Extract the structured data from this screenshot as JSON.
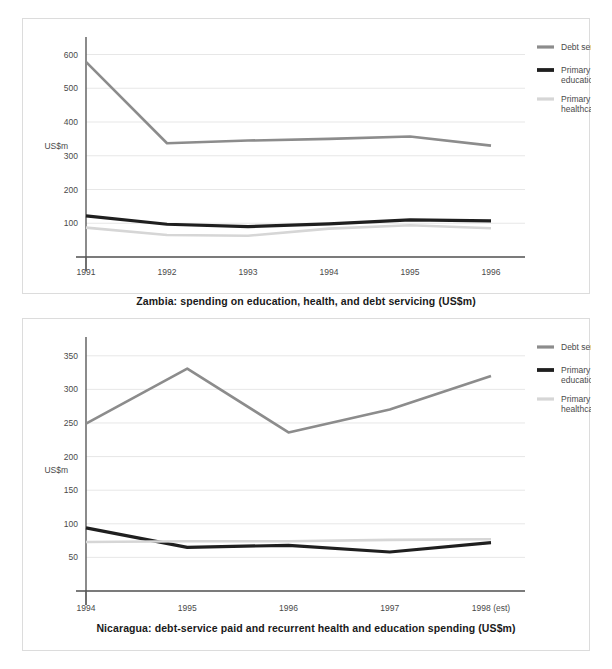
{
  "chart_data": [
    {
      "type": "line",
      "id": "zambia",
      "title": "Zambia: spending on education, health, and debt servicing (US$m)",
      "xlabel": "",
      "ylabel": "US$m",
      "categories": [
        "1991",
        "1992",
        "1993",
        "1994",
        "1995",
        "1996"
      ],
      "yticks": [
        100,
        200,
        300,
        400,
        500,
        600
      ],
      "ylim": [
        0,
        640
      ],
      "grid": true,
      "legend_position": "right",
      "series": [
        {
          "name": "Debt service",
          "color": "#8c8c8c",
          "width": 2.6,
          "values": [
            578,
            337,
            345,
            350,
            357,
            330
          ]
        },
        {
          "name": "Primary education",
          "color": "#1f1f1f",
          "width": 3.2,
          "values": [
            122,
            97,
            90,
            98,
            110,
            107
          ]
        },
        {
          "name": "Primary healthcare",
          "color": "#d6d6d6",
          "width": 2.6,
          "values": [
            87,
            65,
            63,
            84,
            94,
            85
          ]
        }
      ]
    },
    {
      "type": "line",
      "id": "nicaragua",
      "title": "Nicaragua: debt-service paid and recurrent health and education spending (US$m)",
      "xlabel": "",
      "ylabel": "US$m",
      "categories": [
        "1994",
        "1995",
        "1996",
        "1997",
        "1998 (est)"
      ],
      "yticks": [
        50,
        100,
        150,
        200,
        250,
        300,
        350
      ],
      "ylim": [
        0,
        372
      ],
      "grid": true,
      "legend_position": "right",
      "series": [
        {
          "name": "Debt service",
          "color": "#8c8c8c",
          "width": 2.6,
          "values": [
            249,
            331,
            236,
            270,
            320
          ]
        },
        {
          "name": "Primary education",
          "color": "#1f1f1f",
          "width": 3.2,
          "values": [
            94,
            65,
            68,
            58,
            72
          ]
        },
        {
          "name": "Primary healthcare",
          "color": "#d6d6d6",
          "width": 2.6,
          "values": [
            73,
            74,
            74,
            76,
            77
          ]
        }
      ]
    }
  ],
  "legend": {
    "entries": [
      {
        "label": "Debt service"
      },
      {
        "label": "Primary",
        "label2": "education"
      },
      {
        "label": "Primary",
        "label2": "healthcare"
      }
    ]
  }
}
